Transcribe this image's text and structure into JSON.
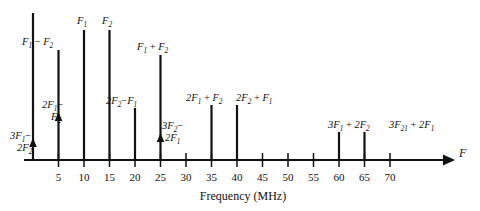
{
  "chart_data": {
    "type": "bar",
    "title": "",
    "xlabel": "Frequency (MHz)",
    "ylabel": "",
    "axis_variable": "F",
    "xlim": [
      0,
      75
    ],
    "grid": false,
    "legend": "none",
    "tick_labels": [
      "5",
      "10",
      "15",
      "20",
      "25",
      "30",
      "35",
      "40",
      "45",
      "50",
      "55",
      "60",
      "65",
      "70"
    ],
    "tick_values": [
      5,
      10,
      15,
      20,
      25,
      30,
      35,
      40,
      45,
      50,
      55,
      60,
      65,
      70
    ],
    "categories": [
      0,
      5,
      10,
      15,
      20,
      25,
      35,
      40,
      60,
      65
    ],
    "values": [
      147,
      110,
      130,
      130,
      52,
      105,
      55,
      55,
      28,
      28
    ],
    "series": [
      {
        "name": "intermodulation products",
        "points": [
          {
            "freq": 0,
            "height": 147,
            "label_parts": [
              {
                "t": "3F",
                "i": true
              },
              {
                "t": "1",
                "sub": true
              },
              {
                "t": "−",
                "op": true
              },
              {
                "t": "2F",
                "i": true
              },
              {
                "t": "2",
                "sub": true
              }
            ],
            "label_text": "3F1-2F2",
            "label_x": 14,
            "label_y": 137,
            "label_y2": 148,
            "two_line": true,
            "line1": "3F1-",
            "line2": "2F2",
            "marker": true,
            "marker_freq": 0
          },
          {
            "freq": 5,
            "height": 110,
            "label_text": "F1-F2",
            "label_x": 31,
            "label_y": 58,
            "two_line": false,
            "marker": true,
            "marker_freq": 5,
            "marker_label": "2F1-F2",
            "marker_label_x": 43,
            "marker_label_y": 116
          },
          {
            "freq": 10,
            "height": 130,
            "label_text": "F1",
            "label_x": 74,
            "label_y": 29
          },
          {
            "freq": 15,
            "height": 130,
            "label_text": "F2",
            "label_x": 101,
            "label_y": 29
          },
          {
            "freq": 20,
            "height": 52,
            "label_text": "2F2-F1",
            "label_x": 104,
            "label_y": 110
          },
          {
            "freq": 25,
            "height": 105,
            "label_text": "F1+F2",
            "label_x": 142,
            "label_y": 62,
            "marker": true,
            "marker_freq": 25,
            "marker_label": "3F2-2F1",
            "marker_label_x": 163,
            "marker_label_y": 126
          },
          {
            "freq": 35,
            "height": 55,
            "label_text": "2F1+F2",
            "label_x": 188,
            "label_y": 108
          },
          {
            "freq": 40,
            "height": 55,
            "label_text": "2F2+F1",
            "label_x": 238,
            "label_y": 108
          },
          {
            "freq": 60,
            "height": 28,
            "label_text": "3F1+2F2",
            "label_x": 330,
            "label_y": 132
          },
          {
            "freq": 65,
            "height": 28,
            "label_text": "3F21+2F1",
            "label_x": 391,
            "label_y": 132
          }
        ]
      }
    ],
    "labels": {
      "spike_0": "3F1-2F2",
      "spike_5": "F1-F2",
      "marker_5": "2F1-F2",
      "spike_10": "F1",
      "spike_15": "F2",
      "spike_20": "2F2-F1",
      "spike_25": "F1+F2",
      "marker_25": "3F2-2F1",
      "spike_35": "2F1+F2",
      "spike_40": "2F2+F1",
      "spike_60": "3F1+2F2",
      "spike_65": "3F21+2F1"
    }
  },
  "axis": {
    "title": "Frequency (MHz)",
    "variable": "F"
  },
  "colors": {
    "ink": "#111111",
    "background": "#ffffff"
  }
}
